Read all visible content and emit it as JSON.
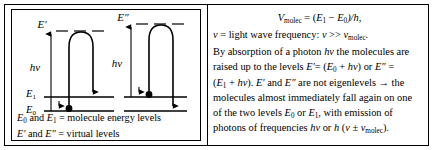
{
  "left_panel": {
    "labels": {
      "e_prime": "E′",
      "e_double_prime": "E″",
      "h_nu_left": "hν",
      "h_nu_right": "hν",
      "e0": "E",
      "e0_sub": "0",
      "e1": "E",
      "e1_sub": "1"
    },
    "legend": {
      "line1_a": "E",
      "line1_a_sub": "0",
      "line1_b": " and ",
      "line1_c": "E",
      "line1_c_sub": "1",
      "line1_d": " =  molecule energy levels",
      "line2_a": "E′",
      "line2_b": " and ",
      "line2_c": "E″",
      "line2_d": " = virtual levels"
    }
  },
  "right_panel": {
    "equation_1": {
      "v": "V",
      "v_sub": "molec",
      "rest": " = (",
      "e1": "E",
      "e1_sub": "1",
      "minus": " − ",
      "e0": "E",
      "e0_sub": "0",
      "tail": ")/h,"
    },
    "equation_2": {
      "nu": "ν",
      "text1": " = light wave frequency: ",
      "nu2": "ν",
      "gg": " >> ",
      "nu3": "ν",
      "nu3_sub": "molec",
      "period": "."
    },
    "paragraph": {
      "line1_a": "By absorption of a photon ",
      "line1_b": "hν",
      "line1_c": " the molecules are",
      "line2_a": "raised up to the levels ",
      "line2_b": "E′",
      "line2_c": "= (",
      "line2_d": "E",
      "line2_d_sub": "0",
      "line2_e": " + ",
      "line2_f": "hν",
      "line2_g": ") or ",
      "line2_h": "E″",
      "line2_i": " =",
      "line3_a": "(",
      "line3_b": "E",
      "line3_b_sub": "1",
      "line3_c": " + ",
      "line3_d": "hν",
      "line3_e": "). ",
      "line3_f": "E′",
      "line3_g": " and ",
      "line3_h": "E″",
      "line3_i": " are not eigenlevels → the",
      "line4": "molecules almost immediately fall again on one",
      "line5_a": "of the two levels ",
      "line5_b": "E",
      "line5_b_sub": "0",
      "line5_c": " or ",
      "line5_d": "E",
      "line5_d_sub": "1",
      "line5_e": ", with emission of",
      "line6_a": "photons of frequencies ",
      "line6_b": "hν",
      "line6_c": " or ",
      "line6_d": "h",
      "line6_e": " (",
      "line6_f": "ν",
      "line6_g": " ± ",
      "line6_h": "ν",
      "line6_h_sub": "molec",
      "line6_i": ")."
    }
  },
  "colors": {
    "stroke": "#000000",
    "background": "#ffffff"
  }
}
